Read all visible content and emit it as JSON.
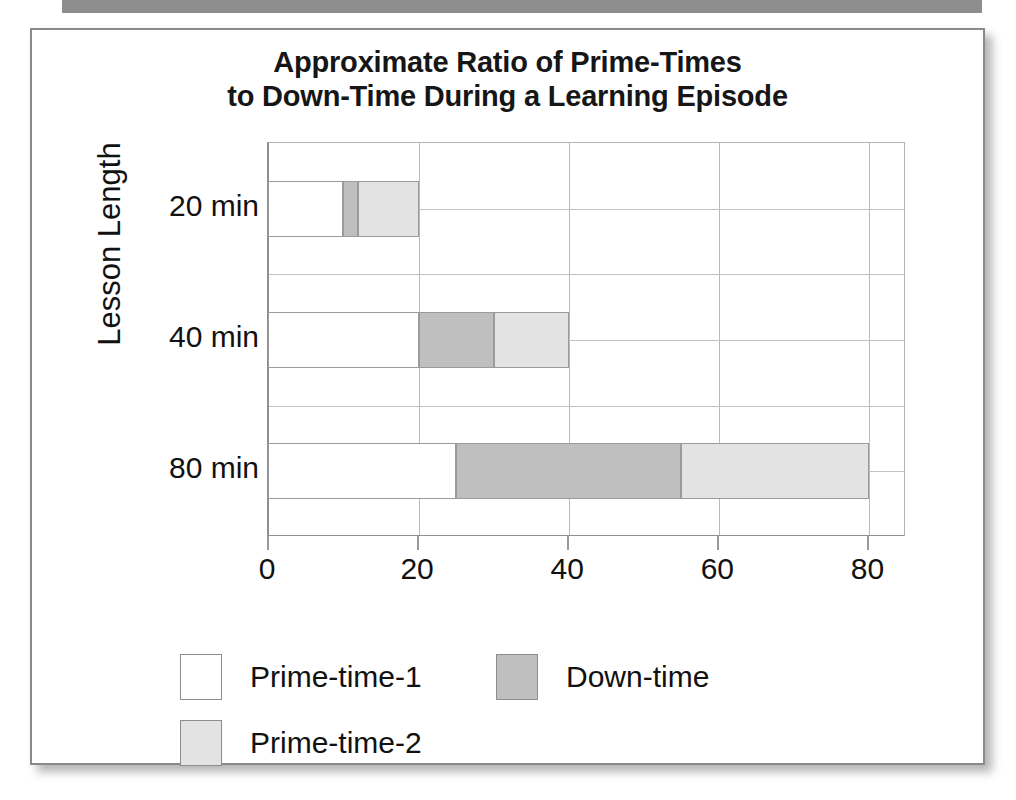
{
  "chart_data": {
    "type": "bar",
    "orientation": "horizontal",
    "stacked": true,
    "title": "Approximate Ratio of Prime-Times to Down-Time During a Learning Episode",
    "title_lines": [
      "Approximate Ratio of Prime-Times",
      "to Down-Time During a Learning Episode"
    ],
    "xlabel": "",
    "ylabel": "Lesson Length",
    "categories": [
      "20 min",
      "40 min",
      "80 min"
    ],
    "xlim": [
      0,
      85
    ],
    "xticks": [
      0,
      20,
      40,
      60,
      80
    ],
    "xticklabels": [
      "0",
      "20",
      "40",
      "60",
      "80"
    ],
    "grid": "vertical-and-horizontal",
    "legend_position": "below",
    "series": [
      {
        "name": "Prime-time-1",
        "color": "#ffffff",
        "values": [
          10,
          20,
          25
        ]
      },
      {
        "name": "Down-time",
        "color": "#bfbfbf",
        "values": [
          2,
          10,
          30
        ]
      },
      {
        "name": "Prime-time-2",
        "color": "#e3e3e3",
        "values": [
          8,
          10,
          25
        ]
      }
    ],
    "bars": [
      {
        "category": "20 min",
        "segments": [
          {
            "series": "Prime-time-1",
            "start": 0,
            "end": 10,
            "value": 10
          },
          {
            "series": "Down-time",
            "start": 10,
            "end": 12,
            "value": 2
          },
          {
            "series": "Prime-time-2",
            "start": 12,
            "end": 20,
            "value": 8
          }
        ],
        "total": 20
      },
      {
        "category": "40 min",
        "segments": [
          {
            "series": "Prime-time-1",
            "start": 0,
            "end": 20,
            "value": 20
          },
          {
            "series": "Down-time",
            "start": 20,
            "end": 30,
            "value": 10
          },
          {
            "series": "Prime-time-2",
            "start": 30,
            "end": 40,
            "value": 10
          }
        ],
        "total": 40
      },
      {
        "category": "80 min",
        "segments": [
          {
            "series": "Prime-time-1",
            "start": 0,
            "end": 25,
            "value": 25
          },
          {
            "series": "Down-time",
            "start": 25,
            "end": 55,
            "value": 30
          },
          {
            "series": "Prime-time-2",
            "start": 55,
            "end": 80,
            "value": 25
          }
        ],
        "total": 80
      }
    ]
  },
  "legend": {
    "items": [
      {
        "label": "Prime-time-1",
        "swatch": "prime1"
      },
      {
        "label": "Prime-time-2",
        "swatch": "prime2"
      },
      {
        "label": "Down-time",
        "swatch": "down"
      }
    ]
  },
  "colors": {
    "prime_time_1": "#ffffff",
    "down_time": "#bfbfbf",
    "prime_time_2": "#e3e3e3",
    "outline": "#8d8d8d",
    "text": "#111111"
  }
}
